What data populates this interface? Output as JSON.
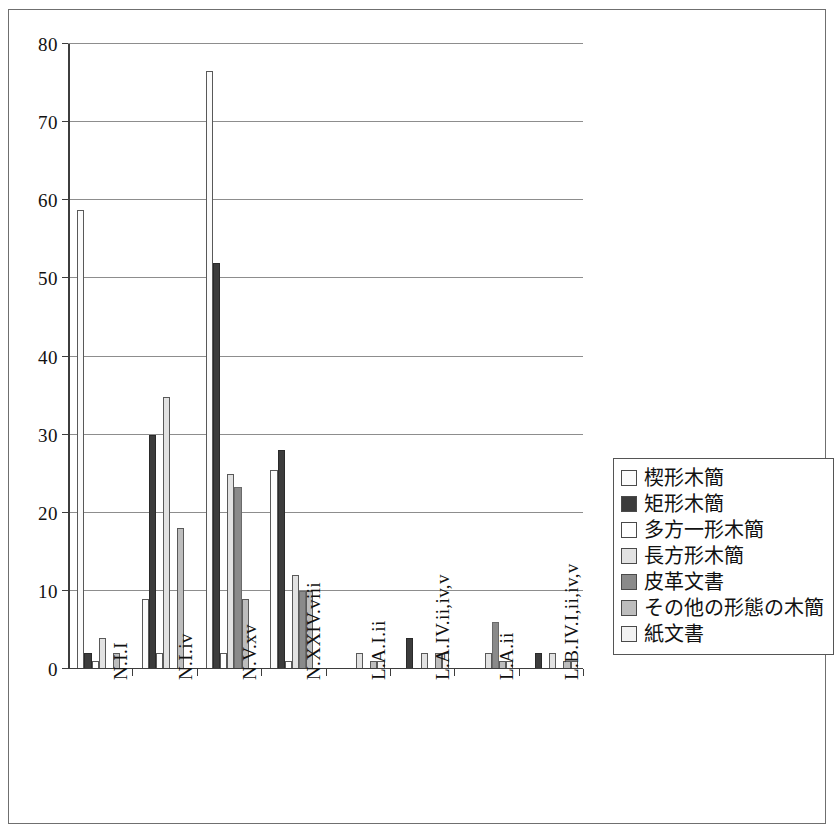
{
  "chart_data": {
    "type": "bar",
    "title": "",
    "xlabel": "",
    "ylabel": "",
    "ylim": [
      0,
      80
    ],
    "ytick_step": 10,
    "yticks": [
      0,
      10,
      20,
      30,
      40,
      50,
      60,
      70,
      80
    ],
    "grid": true,
    "legend_position": "right",
    "categories": [
      "N.I.I",
      "N.I.iv",
      "N.V.xv",
      "N.XXIV.viii",
      "L.A.I.ii",
      "L.A.IV.ii,iv,v",
      "L.A.ii",
      "L.B.IV.I,ii,iv,v"
    ],
    "series": [
      {
        "name": "楔形木簡",
        "color": "#fbfbfb",
        "values": [
          58.8,
          9,
          76.5,
          25.5,
          0,
          0,
          0,
          0
        ]
      },
      {
        "name": "矩形木簡",
        "color": "#3c3c3c",
        "values": [
          2,
          30,
          52,
          28,
          0,
          4,
          0,
          2
        ]
      },
      {
        "name": "多方一形木簡",
        "color": "#ffffff",
        "values": [
          1,
          2,
          2,
          1,
          0,
          0,
          0,
          0
        ]
      },
      {
        "name": "長方形木簡",
        "color": "#e2e2e2",
        "values": [
          4,
          34.8,
          25,
          12,
          2,
          2,
          2,
          2
        ]
      },
      {
        "name": "皮革文書",
        "color": "#8a8a8a",
        "values": [
          0,
          0,
          23.3,
          10,
          0,
          0,
          6,
          0
        ]
      },
      {
        "name": "その他の形態の木簡",
        "color": "#bdbdbd",
        "values": [
          2,
          18,
          9,
          10,
          1,
          2,
          1,
          1
        ]
      },
      {
        "name": "紙文書",
        "color": "#f2f2f2",
        "values": [
          0,
          0,
          0,
          0,
          1,
          2,
          1,
          1
        ]
      }
    ]
  },
  "legend": {
    "items": [
      {
        "label": "楔形木簡"
      },
      {
        "label": "矩形木簡"
      },
      {
        "label": "多方一形木簡"
      },
      {
        "label": "長方形木簡"
      },
      {
        "label": "皮革文書"
      },
      {
        "label": "その他の形態の木簡"
      },
      {
        "label": "紙文書"
      }
    ]
  }
}
